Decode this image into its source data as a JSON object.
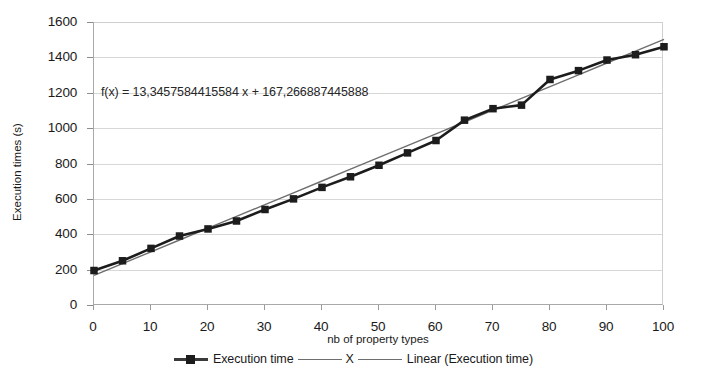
{
  "chart_data": {
    "type": "line",
    "title": "",
    "xlabel": "nb of property types",
    "ylabel": "Execution times (s)",
    "xlim": [
      0,
      100
    ],
    "ylim": [
      0,
      1600
    ],
    "xticks": [
      0,
      10,
      20,
      30,
      40,
      50,
      60,
      70,
      80,
      90,
      100
    ],
    "yticks": [
      0,
      200,
      400,
      600,
      800,
      1000,
      1200,
      1400,
      1600
    ],
    "grid": "horizontal",
    "legend_position": "bottom",
    "annotations": [
      {
        "name": "trendline-equation",
        "text": "f(x) = 13,3457584415584 x + 167,266887445888",
        "x": 1.5,
        "y": 1225
      }
    ],
    "x": [
      0,
      5,
      10,
      15,
      20,
      25,
      30,
      35,
      40,
      45,
      50,
      55,
      60,
      65,
      70,
      75,
      80,
      85,
      90,
      95,
      100
    ],
    "series": [
      {
        "name": "Execution time",
        "style": "line-marker",
        "color": "#1c1c1c",
        "marker": "square",
        "values": [
          195,
          250,
          320,
          390,
          430,
          475,
          540,
          600,
          665,
          725,
          790,
          860,
          930,
          1045,
          1110,
          1130,
          1275,
          1325,
          1385,
          1415,
          1460
        ]
      },
      {
        "name": "Linear (Execution time)",
        "style": "line",
        "color": "#6e6e6e",
        "marker": "none",
        "slope": 13.3457584415584,
        "intercept": 167.266887445888,
        "values": [
          167.3,
          234.0,
          300.8,
          367.5,
          434.2,
          500.9,
          567.6,
          634.3,
          701.1,
          767.8,
          834.5,
          901.2,
          967.9,
          1034.7,
          1101.4,
          1168.1,
          1234.8,
          1301.5,
          1368.3,
          1435.0,
          1501.7
        ]
      }
    ],
    "legend": [
      {
        "label": "Execution time",
        "swatch": "line-with-square-marker"
      },
      {
        "label": "X",
        "swatch": "line"
      },
      {
        "label": "Linear (Execution time)",
        "swatch": "line"
      }
    ]
  },
  "colors": {
    "series_primary": "#1c1c1c",
    "series_trend": "#6e6e6e",
    "gridline": "#d7d7d7",
    "axis": "#a9a9a9",
    "background": "#ffffff",
    "text": "#1a1a1a"
  }
}
